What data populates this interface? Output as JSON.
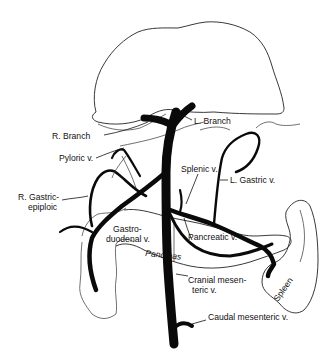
{
  "figure": {
    "type": "anatomical-diagram",
    "colors": {
      "vein": "#0a0a0a",
      "outline": "#222222",
      "background": "#ffffff"
    }
  },
  "labels": {
    "r_branch": "R. Branch",
    "l_branch": "L. Branch",
    "pyloric": "Pyloric v.",
    "splenic": "Splenic v.",
    "l_gastric": "L. Gastric v.",
    "r_gastric_1": "R. Gastric-",
    "r_gastric_2": "epiploic",
    "gastro_1": "Gastro-",
    "gastro_2": "duodenal v.",
    "pancreatic": "Pancreatic v.",
    "pancreas": "Pancreas",
    "cranial_1": "Cranial mesen-",
    "cranial_2": "teric v.",
    "caudal": "Caudal mesenteric v.",
    "spleen": "Spleen"
  },
  "structures": [
    "liver",
    "stomach",
    "pancreas",
    "duodenum",
    "spleen",
    "portal-vein"
  ]
}
